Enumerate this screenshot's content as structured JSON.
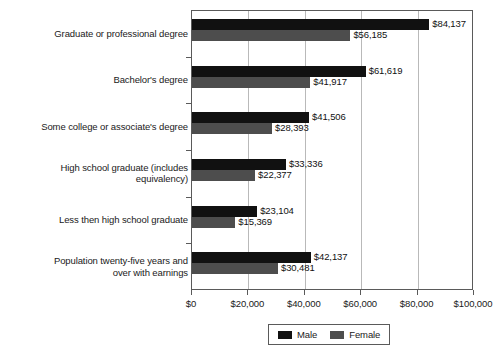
{
  "chart_data": {
    "type": "bar",
    "orientation": "horizontal",
    "title": "",
    "subtitle": "",
    "xlabel": "",
    "ylabel": "",
    "xlim": [
      0,
      100000
    ],
    "grid": true,
    "legend_position": "bottom",
    "categories": [
      "Graduate or professional degree",
      "Bachelor's degree",
      "Some college or associate's degree",
      "High school graduate (includes equivalency)",
      "Less then high school graduate",
      "Population twenty-five years and over with earnings"
    ],
    "series": [
      {
        "name": "Male",
        "color": "#111111",
        "values": [
          84137,
          61619,
          41506,
          33336,
          23104,
          42137
        ],
        "labels": [
          "$84,137",
          "$61,619",
          "$41,506",
          "$33,336",
          "$23,104",
          "$42,137"
        ]
      },
      {
        "name": "Female",
        "color": "#4d4d4d",
        "values": [
          56185,
          41917,
          28393,
          22377,
          15369,
          30481
        ],
        "labels": [
          "$56,185",
          "$41,917",
          "$28,393",
          "$22,377",
          "$15,369",
          "$30,481"
        ]
      }
    ],
    "xticks": [
      0,
      20000,
      40000,
      60000,
      80000,
      100000
    ],
    "xtick_labels": [
      "$0",
      "$20,000",
      "$40,000",
      "$60,000",
      "$80,000",
      "$100,000"
    ]
  },
  "category_lines": [
    [
      "Graduate or professional degree"
    ],
    [
      "Bachelor's degree"
    ],
    [
      "Some college or associate's degree"
    ],
    [
      "High school graduate (includes",
      "equivalency)"
    ],
    [
      "Less then high school graduate"
    ],
    [
      "Population twenty-five years and",
      "over with earnings"
    ]
  ],
  "legend": {
    "items": [
      {
        "label": "Male",
        "color": "#111111"
      },
      {
        "label": "Female",
        "color": "#4d4d4d"
      }
    ]
  }
}
